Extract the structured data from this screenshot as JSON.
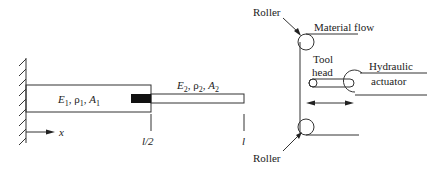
{
  "bar_diagram": {
    "segment1_label": {
      "E": "E",
      "E_sub": "1",
      "rho": "ρ",
      "rho_sub": "1",
      "A": "A",
      "A_sub": "1"
    },
    "segment2_label": {
      "E": "E",
      "E_sub": "2",
      "rho": "ρ",
      "rho_sub": "2",
      "A": "A",
      "A_sub": "2"
    },
    "x_axis_label": "x",
    "midpoint_label": "l/2",
    "end_label": "l"
  },
  "machine_diagram": {
    "roller_top_label": "Roller",
    "roller_bottom_label": "Roller",
    "material_flow_label": "Material flow",
    "tool_head_label_line1": "Tool",
    "tool_head_label_line2": "head",
    "actuator_label_line1": "Hydraulic",
    "actuator_label_line2": "actuator"
  },
  "colors": {
    "line": "#333333",
    "mass": "#111111"
  }
}
